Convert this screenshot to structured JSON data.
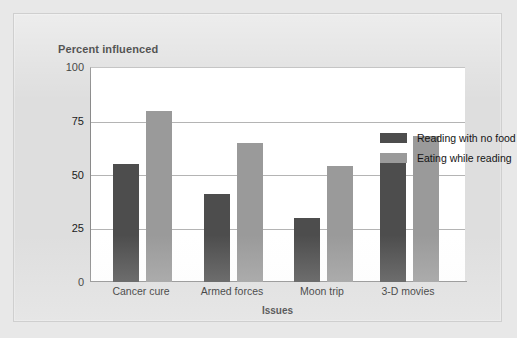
{
  "chart_data": {
    "type": "bar",
    "title": "",
    "ylabel": "Percent influenced",
    "xlabel": "Issues",
    "categories": [
      "Cancer cure",
      "Armed forces",
      "Moon trip",
      "3-D movies"
    ],
    "series": [
      {
        "name": "Reading with no food",
        "color": "#4d4d4d",
        "values": [
          55,
          41,
          30,
          60
        ]
      },
      {
        "name": "Eating while reading",
        "color": "#9a9a9a",
        "values": [
          80,
          65,
          54,
          68
        ]
      }
    ],
    "ylim": [
      0,
      100
    ],
    "yticks": [
      0,
      25,
      50,
      75,
      100
    ],
    "grid": true,
    "legend_position": "top-right"
  },
  "axes": {
    "y_title": "Percent influenced",
    "x_title": "Issues",
    "y_tick_labels": [
      "100",
      "75",
      "50",
      "25",
      "0"
    ],
    "x_tick_labels": [
      "Cancer cure",
      "Armed forces",
      "Moon trip",
      "3-D movies"
    ]
  },
  "legend": {
    "entries": [
      {
        "label": "Reading with no food",
        "swatch": "dark-swatch"
      },
      {
        "label": "Eating while reading",
        "swatch": "light-swatch"
      }
    ]
  },
  "colors": {
    "series_dark": "#4d4d4d",
    "series_light": "#9a9a9a",
    "plot_background": "#ffffff",
    "card_background": "#dedede",
    "gridline": "#b4b4b4",
    "axis": "#8a8a8a"
  }
}
